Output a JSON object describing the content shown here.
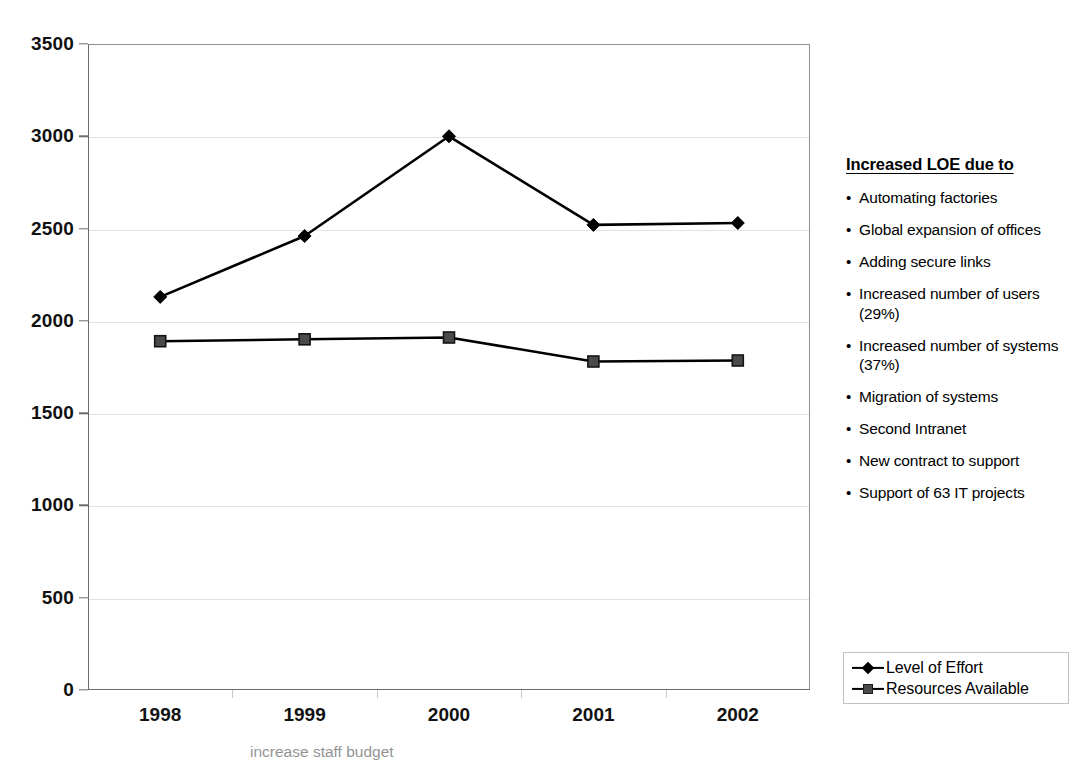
{
  "chart_data": {
    "type": "line",
    "title": "",
    "xlabel": "",
    "ylabel": "",
    "categories": [
      "1998",
      "1999",
      "2000",
      "2001",
      "2002"
    ],
    "ylim": [
      0,
      3500
    ],
    "ytick_values": [
      0,
      500,
      1000,
      1500,
      2000,
      2500,
      3000,
      3500
    ],
    "ytick_labels": [
      "0",
      "500",
      "1000",
      "1500",
      "2000",
      "2500",
      "3000",
      "3500"
    ],
    "grid": true,
    "grid_axis": "y",
    "legend_position": "bottom-right-outside",
    "series": [
      {
        "name": "Level of Effort",
        "marker": "diamond",
        "color": "#000000",
        "values": [
          2130,
          2460,
          3000,
          2520,
          2530
        ]
      },
      {
        "name": "Resources Available",
        "marker": "square",
        "color": "#4a4a4a",
        "values": [
          1890,
          1900,
          1910,
          1780,
          1785
        ]
      }
    ]
  },
  "legend": {
    "items": [
      {
        "label": "Level of Effort",
        "marker": "diamond"
      },
      {
        "label": "Resources Available",
        "marker": "square"
      }
    ]
  },
  "info_panel": {
    "title": "Increased LOE due to",
    "bullet": "•",
    "items": [
      "Automating factories",
      "Global expansion of offices",
      "Adding secure links",
      "Increased number of users (29%)",
      "Increased number of systems (37%)",
      "Migration of systems",
      "Second Intranet",
      "New contract to support",
      "Support of 63 IT projects"
    ]
  },
  "footer": {
    "clipped_text": "increase staff budget"
  },
  "colors": {
    "series_primary": "#000000",
    "series_secondary": "#4a4a4a",
    "gridline": "#e3e3e3",
    "axis": "#6b6b6b",
    "background": "#ffffff"
  }
}
